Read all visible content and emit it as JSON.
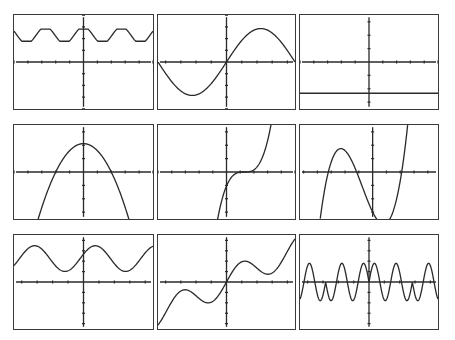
{
  "chart_data": [
    {
      "type": "line",
      "panel": "r1c1",
      "title": "",
      "xlabel": "",
      "ylabel": "",
      "xlim": [
        -10,
        10
      ],
      "ylim": [
        -3.5,
        3.5
      ],
      "x_ticks": 9,
      "y_ticks": 7,
      "series": [
        {
          "name": "f1",
          "fn": "periodic_small",
          "description": "small-amplitude periodic wave above x-axis, ~2.2 periods, y between ~1.5 and ~2.5"
        }
      ]
    },
    {
      "type": "line",
      "panel": "r1c2",
      "title": "",
      "xlabel": "",
      "ylabel": "",
      "xlim": [
        -4,
        4
      ],
      "ylim": [
        -3.5,
        3.5
      ],
      "x_ticks": 8,
      "y_ticks": 7,
      "series": [
        {
          "name": "f2",
          "fn": "sine_full",
          "description": "one full sine period through origin, min ~-2.5 at left, max ~+2.5 at right"
        }
      ]
    },
    {
      "type": "line",
      "panel": "r1c3",
      "title": "",
      "xlabel": "",
      "ylabel": "",
      "xlim": [
        -5,
        5
      ],
      "ylim": [
        -3,
        3
      ],
      "x_ticks": 9,
      "y_ticks": 6,
      "series": [
        {
          "name": "f3",
          "fn": "constant",
          "description": "horizontal line y = -2"
        }
      ]
    },
    {
      "type": "line",
      "panel": "r2c1",
      "title": "",
      "xlabel": "",
      "ylabel": "",
      "xlim": [
        -5,
        5
      ],
      "ylim": [
        -3.3,
        3.3
      ],
      "x_ticks": 9,
      "y_ticks": 6,
      "series": [
        {
          "name": "f4",
          "fn": "parabola_down",
          "description": "downward parabola, vertex (0,2), roots near x=±2"
        }
      ]
    },
    {
      "type": "line",
      "panel": "r2c2",
      "title": "",
      "xlabel": "",
      "ylabel": "",
      "xlim": [
        -5,
        5
      ],
      "ylim": [
        -3.3,
        3.3
      ],
      "x_ticks": 9,
      "y_ticks": 6,
      "series": [
        {
          "name": "f5",
          "fn": "cubic_shifted",
          "description": "cubic with inflection near (1.3, 0), steep rise right, steep fall left"
        }
      ]
    },
    {
      "type": "line",
      "panel": "r2c3",
      "title": "",
      "xlabel": "",
      "ylabel": "",
      "xlim": [
        -5,
        4.5
      ],
      "ylim": [
        -3.3,
        3.3
      ],
      "x_ticks": 9,
      "y_ticks": 6,
      "series": [
        {
          "name": "f6",
          "fn": "cubic_two_turns",
          "description": "cubic with local max near (-2.1,1.4) and local min near (0.9,-2.7), roots near -3, -1.1, 2"
        }
      ]
    },
    {
      "type": "line",
      "panel": "r3c1",
      "title": "",
      "xlabel": "",
      "ylabel": "",
      "xlim": [
        -10,
        10
      ],
      "ylim": [
        -4,
        4
      ],
      "x_ticks": 8,
      "y_ticks": 8,
      "series": [
        {
          "name": "f7",
          "fn": "sine_shifted_up",
          "description": "sinusoid oscillating above x-axis, between ~1 and ~3, ~2 periods"
        }
      ]
    },
    {
      "type": "line",
      "panel": "r3c2",
      "title": "",
      "xlabel": "",
      "ylabel": "",
      "xlim": [
        -10,
        10
      ],
      "ylim": [
        -4,
        4
      ],
      "x_ticks": 8,
      "y_ticks": 8,
      "series": [
        {
          "name": "f8",
          "fn": "x_plus_sin",
          "description": "increasing oscillating curve through origin (like x/5 + sin x)"
        }
      ]
    },
    {
      "type": "line",
      "panel": "r3c3",
      "title": "",
      "xlabel": "",
      "ylabel": "",
      "xlim": [
        -10,
        10
      ],
      "ylim": [
        -4,
        4
      ],
      "x_ticks": 8,
      "y_ticks": 8,
      "series": [
        {
          "name": "f9",
          "fn": "sine_product",
          "description": "high-frequency sine bumps alternating above/below axis in pairs (sin(2x) with sign flips)"
        }
      ]
    }
  ],
  "panels": [
    {
      "id": "r1c1",
      "x": 13,
      "y": 14,
      "w": 141,
      "h": 96
    },
    {
      "id": "r1c2",
      "x": 157,
      "y": 14,
      "w": 139,
      "h": 96
    },
    {
      "id": "r1c3",
      "x": 299,
      "y": 14,
      "w": 140,
      "h": 96
    },
    {
      "id": "r2c1",
      "x": 13,
      "y": 124,
      "w": 141,
      "h": 96
    },
    {
      "id": "r2c2",
      "x": 157,
      "y": 124,
      "w": 139,
      "h": 96
    },
    {
      "id": "r2c3",
      "x": 299,
      "y": 124,
      "w": 140,
      "h": 96
    },
    {
      "id": "r3c1",
      "x": 13,
      "y": 234,
      "w": 141,
      "h": 96
    },
    {
      "id": "r3c2",
      "x": 157,
      "y": 234,
      "w": 139,
      "h": 96
    },
    {
      "id": "r3c3",
      "x": 299,
      "y": 234,
      "w": 140,
      "h": 96
    }
  ],
  "colors": {
    "curve": "#2a2a2a",
    "axis": "#2a2a2a",
    "frame": "#3a3a3a",
    "background": "#ffffff"
  }
}
